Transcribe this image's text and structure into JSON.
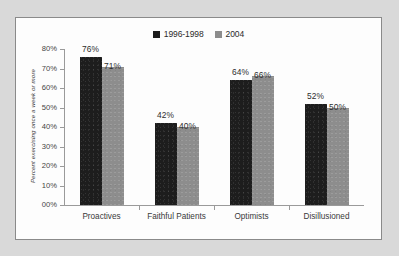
{
  "chart_data": {
    "type": "bar",
    "title": "",
    "xlabel": "",
    "ylabel": "Percent exercising once a week or more",
    "ylim": [
      0,
      80
    ],
    "ytick_labels": [
      "00%",
      "10%",
      "20%",
      "30%",
      "40%",
      "50%",
      "60%",
      "70%",
      "80%"
    ],
    "ytick_values": [
      0,
      10,
      20,
      30,
      40,
      50,
      60,
      70,
      80
    ],
    "grid": false,
    "legend_position": "top-center",
    "categories": [
      "Proactives",
      "Faithful Patients",
      "Optimists",
      "Disillusioned"
    ],
    "series": [
      {
        "name": "1996-1998",
        "color": "#1d1d1d",
        "values": [
          76,
          71,
          64,
          52
        ],
        "value_labels": [
          "76%",
          "42%",
          "64%",
          "52%"
        ]
      },
      {
        "name": "2004",
        "color": "#8d8d8d",
        "values": [
          71,
          40,
          66,
          50
        ],
        "value_labels": [
          "71%",
          "40%",
          "66%",
          "50%"
        ]
      }
    ],
    "groups": [
      {
        "category": "Proactives",
        "bars": [
          {
            "series": "1996-1998",
            "value": 76,
            "label": "76%"
          },
          {
            "series": "2004",
            "value": 71,
            "label": "71%"
          }
        ]
      },
      {
        "category": "Faithful Patients",
        "bars": [
          {
            "series": "1996-1998",
            "value": 42,
            "label": "42%"
          },
          {
            "series": "2004",
            "value": 40,
            "label": "40%"
          }
        ]
      },
      {
        "category": "Optimists",
        "bars": [
          {
            "series": "1996-1998",
            "value": 64,
            "label": "64%"
          },
          {
            "series": "2004",
            "value": 66,
            "label": "66%"
          }
        ]
      },
      {
        "category": "Disillusioned",
        "bars": [
          {
            "series": "1996-1998",
            "value": 52,
            "label": "52%"
          },
          {
            "series": "2004",
            "value": 50,
            "label": "50%"
          }
        ]
      }
    ]
  },
  "legend": {
    "entries": [
      {
        "label": "1996-1998",
        "swatch": "#1d1d1d"
      },
      {
        "label": "2004",
        "swatch": "#8d8d8d"
      }
    ]
  },
  "colors": {
    "series_1996_1998": "#1d1d1d",
    "series_2004": "#8d8d8d",
    "axis": "#9a9a9a",
    "frame_border": "#8a8a8a",
    "page_background": "#d9d9d9",
    "plot_background": "#fdfdfd"
  }
}
